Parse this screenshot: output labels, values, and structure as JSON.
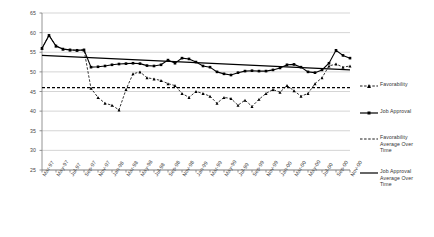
{
  "chart_data": {
    "type": "line",
    "title": "",
    "subtitle": "",
    "xlabel": "",
    "ylabel": "",
    "ylim": [
      25,
      65
    ],
    "ytick_step": 5,
    "yticks": [
      25,
      30,
      35,
      40,
      45,
      50,
      55,
      60,
      65
    ],
    "grid": true,
    "legend_position": "right",
    "categories": [
      "Mar-97",
      "Apr-97",
      "May-97",
      "Jun-97",
      "Jul-97",
      "Aug-97",
      "Sep-97",
      "Oct-97",
      "Nov-97",
      "Dec-97",
      "Jan-98",
      "Feb-98",
      "Mar-98",
      "Apr-98",
      "May-98",
      "Jun-98",
      "Jul-98",
      "Aug-98",
      "Sep-98",
      "Oct-98",
      "Nov-98",
      "Dec-98",
      "Jan-99",
      "Feb-99",
      "Mar-99",
      "Apr-99",
      "May-99",
      "Jun-99",
      "Jul-99",
      "Aug-99",
      "Sep-99",
      "Oct-99",
      "Nov-99",
      "Dec-99",
      "Jan-00",
      "Feb-00",
      "Mar-00",
      "Apr-00",
      "May-00",
      "Jun-00",
      "Jul-00",
      "Aug-00",
      "Sep-00",
      "Oct-00",
      "Nov-00"
    ],
    "tick_labels": [
      "Mar-97",
      "May-97",
      "Jul-97",
      "Sep-97",
      "Nov-97",
      "Jan-98",
      "Mar-98",
      "May-98",
      "Jul-98",
      "Sep-98",
      "Nov-98",
      "Jan-99",
      "Mar-99",
      "May-99",
      "Jul-99",
      "Sep-99",
      "Nov-99",
      "Jan-00",
      "Mar-00",
      "May-00",
      "Jul-00",
      "Sep-00",
      "Nov-00"
    ],
    "series": [
      {
        "name": "Favorability",
        "style": "dashed-marker",
        "values": [
          56.0,
          59.3,
          56.6,
          55.8,
          55.6,
          55.5,
          55.6,
          45.8,
          43.5,
          42.0,
          41.5,
          40.3,
          45.5,
          49.5,
          50.0,
          48.5,
          48.2,
          47.8,
          47.0,
          46.5,
          44.5,
          43.5,
          45.0,
          44.5,
          43.8,
          42.0,
          43.5,
          43.2,
          41.5,
          42.8,
          41.2,
          43.0,
          44.5,
          45.5,
          44.8,
          46.5,
          45.2,
          43.8,
          44.5,
          47.0,
          48.5,
          51.5,
          52.0,
          51.2,
          51.5
        ]
      },
      {
        "name": "Job Approval",
        "style": "solid-marker",
        "values": [
          56.0,
          59.3,
          56.6,
          55.8,
          55.6,
          55.5,
          55.6,
          51.2,
          51.3,
          51.5,
          51.8,
          52.0,
          52.1,
          52.2,
          52.1,
          51.6,
          51.5,
          51.8,
          53.0,
          52.2,
          53.5,
          53.3,
          52.5,
          51.5,
          51.2,
          50.0,
          49.5,
          49.2,
          49.8,
          50.2,
          50.3,
          50.2,
          50.2,
          50.5,
          51.0,
          51.8,
          51.9,
          51.2,
          50.0,
          49.8,
          50.5,
          52.2,
          55.5,
          54.2,
          53.5
        ]
      }
    ],
    "reference_lines": [
      {
        "name": "Favorability Average Over Time",
        "style": "dashed",
        "value": 46.0
      },
      {
        "name": "Job Approval Average Over Time",
        "style": "solid",
        "start": 54.2,
        "end": 50.5
      }
    ],
    "legend": [
      {
        "label": "Favorability",
        "style": "dashed-marker"
      },
      {
        "label": "Job Approval",
        "style": "solid-marker"
      },
      {
        "label": "Favorability\nAverage Over\nTime",
        "style": "dashed"
      },
      {
        "label": "Job Approval\nAverage Over\nTime",
        "style": "solid"
      }
    ]
  }
}
